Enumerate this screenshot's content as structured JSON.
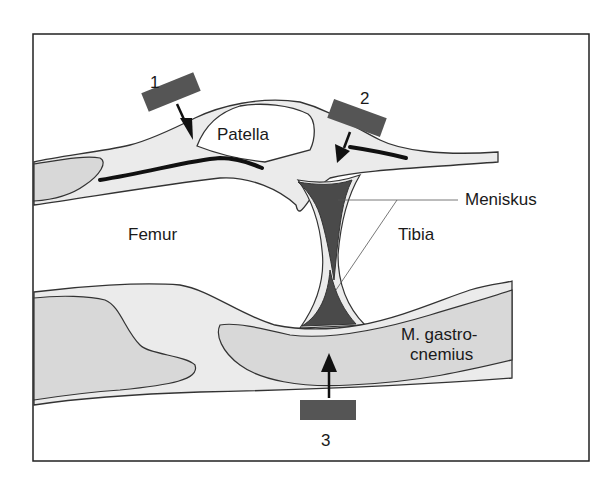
{
  "diagram": {
    "type": "anatomical cross-section",
    "labels": {
      "patella": "Patella",
      "femur": "Femur",
      "tibia": "Tibia",
      "meniskus": "Meniskus",
      "gastrocnemius_line1": "M. gastro-",
      "gastrocnemius_line2": "cnemius"
    },
    "probes": [
      {
        "id": "1",
        "label": "1"
      },
      {
        "id": "2",
        "label": "2"
      },
      {
        "id": "3",
        "label": "3"
      }
    ],
    "colors": {
      "frame": "#222222",
      "soft_tissue": "#ebebeb",
      "muscle": "#d6d6d6",
      "meniscus": "#4a4a4a",
      "probe": "#555555",
      "tendon": "#111111"
    }
  }
}
